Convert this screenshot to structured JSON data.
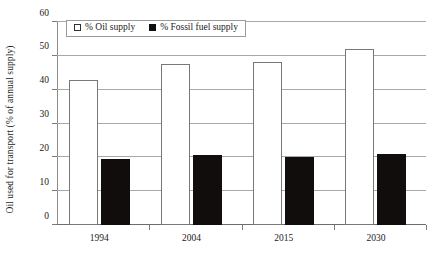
{
  "chart_data": {
    "type": "bar",
    "title": "",
    "xlabel": "",
    "ylabel": "Oil used for transport (% of annual supply)",
    "categories": [
      "1994",
      "2004",
      "2015",
      "2030"
    ],
    "series": [
      {
        "name": "% Oil supply",
        "color": "#ffffff",
        "values": [
          43,
          47.5,
          48.3,
          52
        ]
      },
      {
        "name": "% Fossil fuel supply",
        "color": "#120d0d",
        "values": [
          19.5,
          20.7,
          20.2,
          21
        ]
      }
    ],
    "ylim": [
      0,
      60
    ],
    "yticks": [
      0,
      10,
      20,
      30,
      40,
      50,
      60
    ],
    "ytick_labels": [
      "0",
      "10",
      "20",
      "30",
      "40",
      "50",
      "60"
    ],
    "grid": true,
    "legend_position": "top-left"
  },
  "legend": {
    "items": [
      {
        "label": "% Oil supply",
        "swatch": "open-square"
      },
      {
        "label": "% Fossil fuel supply",
        "swatch": "filled-square"
      }
    ]
  }
}
